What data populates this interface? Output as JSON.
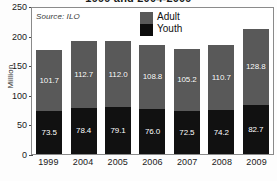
{
  "chart_data": {
    "type": "bar",
    "subtype": "stacked-bar",
    "title": "1999 and 2004-2009",
    "source_note": "Source: ILO",
    "categories": [
      "1999",
      "2004",
      "2005",
      "2006",
      "2007",
      "2008",
      "2009"
    ],
    "series": [
      {
        "name": "Adult",
        "color": "#595959",
        "values": [
          101.7,
          112.7,
          112.0,
          108.8,
          105.2,
          110.7,
          128.8
        ],
        "labels": [
          "101.7",
          "112.7",
          "112.0",
          "108.8",
          "105.2",
          "110.7",
          "128.8"
        ]
      },
      {
        "name": "Youth",
        "color": "#111111",
        "values": [
          73.5,
          78.4,
          79.1,
          76.0,
          72.5,
          74.2,
          82.7
        ],
        "labels": [
          "73.5",
          "78.4",
          "79.1",
          "76.0",
          "72.5",
          "74.2",
          "82.7"
        ]
      }
    ],
    "totals": [
      175.2,
      191.1,
      191.1,
      184.8,
      177.7,
      184.9,
      211.5
    ],
    "xlabel": "",
    "ylabel": "Million",
    "ylim": [
      0,
      250
    ],
    "yticks": [
      0,
      50,
      100,
      150,
      200,
      250
    ],
    "ytick_labels": [
      "0",
      "50",
      "100",
      "150",
      "200",
      "250"
    ],
    "grid": false,
    "legend_position": "top-center",
    "legend_entries": [
      "Adult",
      "Youth"
    ]
  }
}
